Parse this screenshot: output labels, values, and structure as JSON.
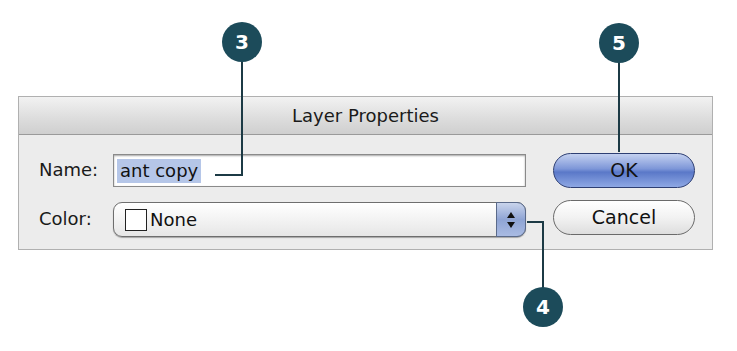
{
  "dialog": {
    "title": "Layer Properties",
    "name_label": "Name:",
    "name_value": "ant copy",
    "color_label": "Color:",
    "color_value": "None",
    "ok_label": "OK",
    "cancel_label": "Cancel"
  },
  "callouts": [
    {
      "number": "3",
      "target": "name-field"
    },
    {
      "number": "5",
      "target": "ok-button"
    },
    {
      "number": "4",
      "target": "color-popup-stepper"
    }
  ],
  "colors": {
    "callout": "#1c4b5a",
    "selection": "#b5c6e8",
    "ok_button": "#6a86d0"
  }
}
